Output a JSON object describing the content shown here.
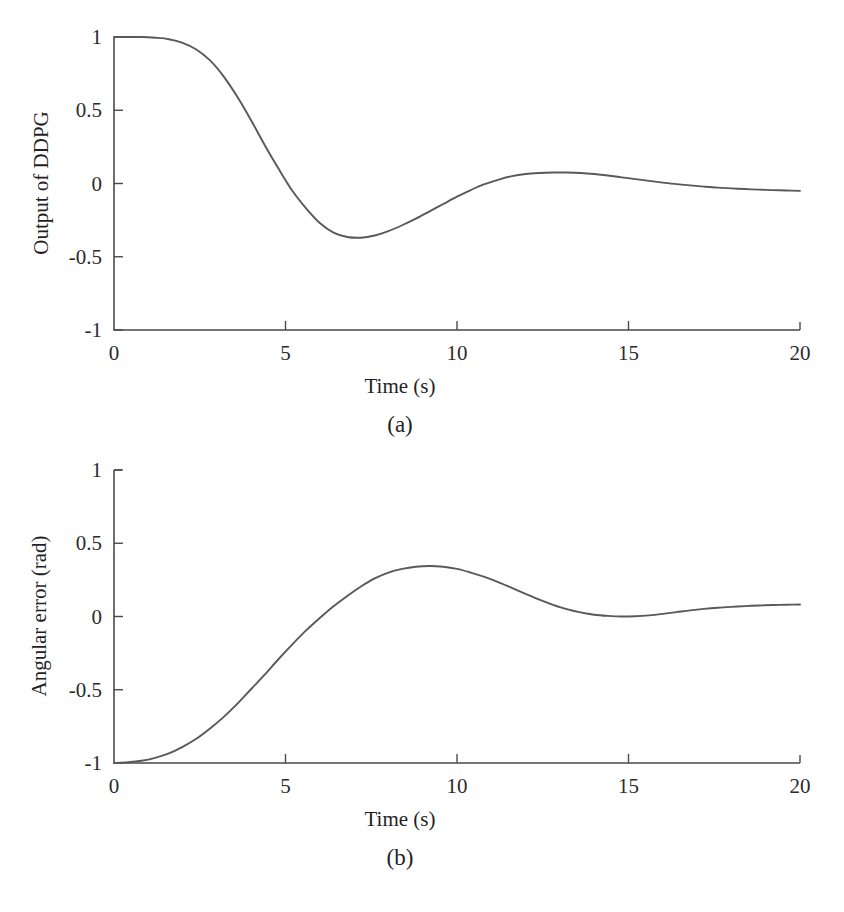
{
  "figure": {
    "panels": [
      {
        "id": "a",
        "caption": "(a)",
        "xlabel": "Time (s)",
        "ylabel": "Output of DDPG",
        "x_ticks": [
          "0",
          "5",
          "10",
          "15",
          "20"
        ],
        "y_ticks": [
          "1",
          "0.5",
          "0",
          "-0.5",
          "-1"
        ]
      },
      {
        "id": "b",
        "caption": "(b)",
        "xlabel": "Time (s)",
        "ylabel": "Angular error (rad)",
        "x_ticks": [
          "0",
          "5",
          "10",
          "15",
          "20"
        ],
        "y_ticks": [
          "1",
          "0.5",
          "0",
          "-0.5",
          "-1"
        ]
      }
    ]
  },
  "chart_data": [
    {
      "type": "line",
      "panel": "a",
      "title": "",
      "xlabel": "Time (s)",
      "ylabel": "Output of DDPG",
      "xlim": [
        0,
        20
      ],
      "ylim": [
        -1,
        1
      ],
      "xticks": [
        0,
        5,
        10,
        15,
        20
      ],
      "yticks": [
        -1,
        -0.5,
        0,
        0.5,
        1
      ],
      "grid": false,
      "legend": null,
      "line_color": "#595959",
      "series": [
        {
          "name": "Output of DDPG",
          "x": [
            0,
            0.4,
            0.8,
            1.2,
            1.6,
            2.0,
            2.4,
            2.8,
            3.2,
            3.6,
            4.0,
            4.4,
            4.8,
            5.2,
            5.6,
            6.0,
            6.4,
            6.8,
            7.2,
            7.6,
            8.0,
            8.4,
            8.8,
            9.2,
            9.6,
            10.0,
            10.4,
            10.8,
            11.2,
            11.6,
            12.0,
            12.4,
            12.8,
            13.2,
            13.6,
            14.0,
            14.4,
            14.8,
            15.2,
            15.6,
            16.0,
            16.4,
            16.8,
            17.2,
            17.6,
            18.0,
            18.4,
            18.8,
            19.2,
            19.6,
            20.0
          ],
          "y": [
            1.0,
            1.0,
            1.0,
            0.995,
            0.985,
            0.96,
            0.915,
            0.84,
            0.73,
            0.59,
            0.43,
            0.26,
            0.1,
            -0.05,
            -0.17,
            -0.27,
            -0.335,
            -0.365,
            -0.37,
            -0.355,
            -0.325,
            -0.285,
            -0.24,
            -0.19,
            -0.14,
            -0.09,
            -0.045,
            -0.005,
            0.025,
            0.05,
            0.065,
            0.072,
            0.075,
            0.075,
            0.072,
            0.065,
            0.055,
            0.042,
            0.03,
            0.018,
            0.006,
            -0.004,
            -0.013,
            -0.021,
            -0.028,
            -0.033,
            -0.038,
            -0.042,
            -0.045,
            -0.048,
            -0.05
          ]
        }
      ],
      "annotations": {
        "initial_value": 1.0,
        "minimum": {
          "t": 7.0,
          "value": -0.37
        },
        "maximum_after_min": {
          "t": 13.1,
          "value": 0.075
        },
        "final_value": -0.05
      }
    },
    {
      "type": "line",
      "panel": "b",
      "title": "",
      "xlabel": "Time (s)",
      "ylabel": "Angular error (rad)",
      "xlim": [
        0,
        20
      ],
      "ylim": [
        -1,
        1
      ],
      "xticks": [
        0,
        5,
        10,
        15,
        20
      ],
      "yticks": [
        -1,
        -0.5,
        0,
        0.5,
        1
      ],
      "grid": false,
      "legend": null,
      "line_color": "#595959",
      "series": [
        {
          "name": "Angular error (rad)",
          "x": [
            0,
            0.4,
            0.8,
            1.2,
            1.6,
            2.0,
            2.4,
            2.8,
            3.2,
            3.6,
            4.0,
            4.4,
            4.8,
            5.2,
            5.6,
            6.0,
            6.4,
            6.8,
            7.2,
            7.6,
            8.0,
            8.4,
            8.8,
            9.2,
            9.6,
            10.0,
            10.4,
            10.8,
            11.2,
            11.6,
            12.0,
            12.4,
            12.8,
            13.2,
            13.6,
            14.0,
            14.4,
            14.8,
            15.2,
            15.6,
            16.0,
            16.4,
            16.8,
            17.2,
            17.6,
            18.0,
            18.4,
            18.8,
            19.2,
            19.6,
            20.0
          ],
          "y": [
            -1.0,
            -0.995,
            -0.985,
            -0.965,
            -0.935,
            -0.89,
            -0.835,
            -0.765,
            -0.685,
            -0.595,
            -0.495,
            -0.395,
            -0.29,
            -0.19,
            -0.095,
            -0.01,
            0.07,
            0.14,
            0.205,
            0.26,
            0.3,
            0.325,
            0.34,
            0.345,
            0.34,
            0.325,
            0.3,
            0.27,
            0.235,
            0.195,
            0.155,
            0.115,
            0.08,
            0.05,
            0.028,
            0.012,
            0.004,
            0.0,
            0.002,
            0.008,
            0.018,
            0.03,
            0.042,
            0.052,
            0.06,
            0.066,
            0.071,
            0.075,
            0.078,
            0.08,
            0.082
          ]
        }
      ],
      "annotations": {
        "initial_value": -1.0,
        "maximum": {
          "t": 9.2,
          "value": 0.345
        },
        "minimum_after_max": {
          "t": 14.8,
          "value": 0.0
        },
        "final_value": 0.082
      }
    }
  ]
}
